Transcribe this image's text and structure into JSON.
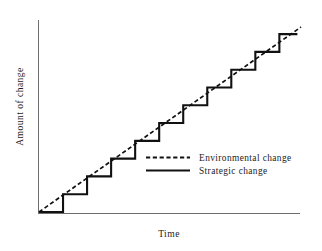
{
  "chart_data": {
    "type": "line",
    "title": "",
    "xlabel": "Time",
    "ylabel": "Amount of change",
    "grid": false,
    "xlim": [
      0,
      10.9
    ],
    "ylim": [
      0,
      10.4
    ],
    "legend_position": "inside-lower-right",
    "series": [
      {
        "name": "Environmental change",
        "style": "dashed",
        "color": "#111111",
        "x": [
          0,
          10.9
        ],
        "y": [
          0,
          10.4
        ]
      },
      {
        "name": "Strategic change",
        "style": "solid-step",
        "color": "#111111",
        "step_count": 10,
        "x": [
          0,
          1,
          1,
          2,
          2,
          3,
          3,
          4,
          4,
          5,
          5,
          6,
          6,
          7,
          7,
          8,
          8,
          9,
          9,
          10,
          10,
          10.75
        ],
        "y": [
          0,
          0,
          1,
          1,
          2,
          2,
          3,
          3,
          4,
          4,
          5,
          5,
          6,
          6,
          7,
          7,
          8,
          8,
          9,
          9,
          10,
          10
        ]
      }
    ]
  },
  "axes": {
    "ylabel": "Amount of change",
    "xlabel": "Time"
  },
  "legend": {
    "entries": [
      {
        "label": "Environmental change",
        "swatch": "dashed-line-swatch"
      },
      {
        "label": "Strategic change",
        "swatch": "solid-line-swatch"
      }
    ]
  }
}
